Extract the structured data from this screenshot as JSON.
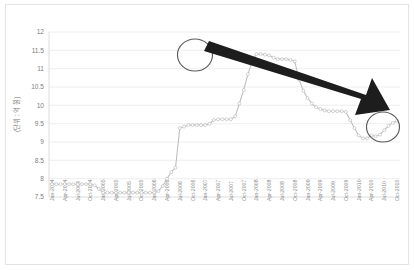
{
  "chart_data": {
    "type": "line",
    "title": "",
    "xlabel": "",
    "ylabel": "(단위 : 억 원)",
    "ylim": [
      7.5,
      12
    ],
    "ytick_values": [
      12,
      11.5,
      11,
      10.5,
      10,
      9.5,
      9,
      8.5,
      8,
      7.5
    ],
    "ytick_labels": [
      "12",
      "11.5",
      "11",
      "10.5",
      "10",
      "9.5",
      "9",
      "8.5",
      "8",
      "7.5"
    ],
    "grid": true,
    "legend": "none",
    "xtick_labels": [
      "Jan-2004",
      "Apr-2004",
      "Jul-2004",
      "Oct-2004",
      "Jan-2005",
      "Apr-2005",
      "Jul-2005",
      "Oct-2005",
      "Jan-2006",
      "Apr-2006",
      "Jul-2006",
      "Oct-2006",
      "Jan-2007",
      "Apr-2007",
      "Jul-2007",
      "Oct-2007",
      "Jan-2008",
      "Apr-2008",
      "Jul-2008",
      "Oct-2008",
      "Jan-2009",
      "Apr-2009",
      "Jul-2009",
      "Oct-2009",
      "Jan-2010",
      "Apr-2010",
      "Jul-2010",
      "Oct-2010"
    ],
    "x": [
      "Jan-2004",
      "Feb-2004",
      "Mar-2004",
      "Apr-2004",
      "May-2004",
      "Jun-2004",
      "Jul-2004",
      "Aug-2004",
      "Sep-2004",
      "Oct-2004",
      "Nov-2004",
      "Dec-2004",
      "Jan-2005",
      "Feb-2005",
      "Mar-2005",
      "Apr-2005",
      "May-2005",
      "Jun-2005",
      "Jul-2005",
      "Aug-2005",
      "Sep-2005",
      "Oct-2005",
      "Nov-2005",
      "Dec-2005",
      "Jan-2006",
      "Feb-2006",
      "Mar-2006",
      "Apr-2006",
      "May-2006",
      "Jun-2006",
      "Jul-2006",
      "Aug-2006",
      "Sep-2006",
      "Oct-2006",
      "Nov-2006",
      "Dec-2006",
      "Jan-2007",
      "Feb-2007",
      "Mar-2007",
      "Apr-2007",
      "May-2007",
      "Jun-2007",
      "Jul-2007",
      "Aug-2007",
      "Sep-2007",
      "Oct-2007",
      "Nov-2007",
      "Dec-2007",
      "Jan-2008",
      "Feb-2008",
      "Mar-2008",
      "Apr-2008",
      "May-2008",
      "Jun-2008",
      "Jul-2008",
      "Aug-2008",
      "Sep-2008",
      "Oct-2008",
      "Nov-2008",
      "Dec-2008",
      "Jan-2009",
      "Feb-2009",
      "Mar-2009",
      "Apr-2009",
      "May-2009",
      "Jun-2009",
      "Jul-2009",
      "Aug-2009",
      "Sep-2009",
      "Oct-2009",
      "Nov-2009",
      "Dec-2009",
      "Jan-2010",
      "Feb-2010",
      "Mar-2010",
      "Apr-2010",
      "May-2010",
      "Jun-2010",
      "Jul-2010",
      "Aug-2010",
      "Sep-2010",
      "Oct-2010"
    ],
    "values": [
      7.85,
      7.85,
      7.85,
      7.85,
      7.85,
      7.85,
      7.85,
      7.85,
      7.85,
      7.85,
      7.82,
      7.72,
      7.62,
      7.62,
      7.62,
      7.62,
      7.62,
      7.62,
      7.62,
      7.62,
      7.62,
      7.62,
      7.62,
      7.62,
      7.62,
      7.66,
      7.8,
      8.0,
      8.18,
      8.3,
      9.38,
      9.42,
      9.46,
      9.46,
      9.46,
      9.46,
      9.46,
      9.5,
      9.6,
      9.62,
      9.62,
      9.62,
      9.62,
      9.7,
      10.05,
      10.42,
      10.85,
      11.2,
      11.4,
      11.4,
      11.38,
      11.36,
      11.3,
      11.26,
      11.26,
      11.26,
      11.24,
      11.2,
      10.7,
      10.4,
      10.2,
      10.05,
      9.95,
      9.9,
      9.86,
      9.84,
      9.84,
      9.84,
      9.84,
      9.82,
      9.6,
      9.38,
      9.18,
      9.1,
      9.1,
      9.18,
      9.16,
      9.2,
      9.32,
      9.44,
      9.52,
      9.58
    ],
    "annotations": [
      {
        "name": "peak-highlight-ellipse",
        "type": "ellipse",
        "at": "Jan-2008",
        "value": 11.4
      },
      {
        "name": "end-highlight-ellipse",
        "type": "ellipse",
        "at": "Oct-2010",
        "value": 9.58
      },
      {
        "name": "decline-trend-arrow",
        "type": "arrow",
        "from": "Jan-2008",
        "to": "Oct-2010",
        "direction": "down-right"
      }
    ]
  }
}
